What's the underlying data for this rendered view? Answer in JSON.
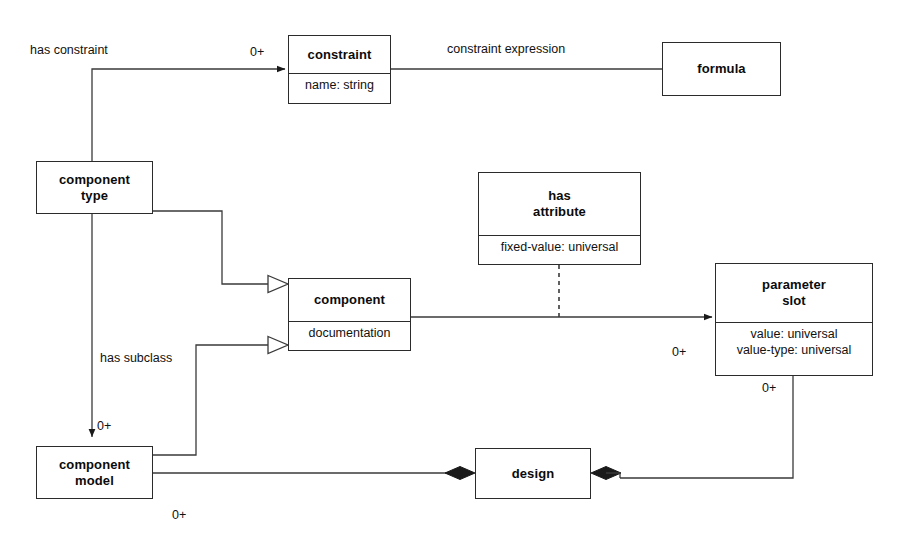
{
  "diagram": {
    "stroke_color": "#2b2b2b",
    "text_color": "#111111",
    "background": "#ffffff",
    "nodes": [
      {
        "id": "constraint",
        "title": "constraint",
        "attributes": [
          "name: string"
        ],
        "x": 288,
        "y": 35,
        "width": 103,
        "height": 69,
        "title_height": 33
      },
      {
        "id": "formula",
        "title": "formula",
        "attributes": [],
        "x": 662,
        "y": 42,
        "width": 119,
        "height": 54,
        "title_height": 54
      },
      {
        "id": "component-type",
        "title": "component\ntype",
        "attributes": [],
        "x": 36,
        "y": 161,
        "width": 117,
        "height": 53,
        "title_height": 53
      },
      {
        "id": "has-attribute",
        "title": "has\nattribute",
        "attributes": [
          "fixed-value: universal"
        ],
        "x": 478,
        "y": 172,
        "width": 163,
        "height": 93,
        "title_height": 58
      },
      {
        "id": "component",
        "title": "component",
        "attributes": [
          "documentation"
        ],
        "x": 288,
        "y": 278,
        "width": 123,
        "height": 73,
        "title_height": 38
      },
      {
        "id": "parameter-slot",
        "title": "parameter\nslot",
        "attributes": [
          "value: universal",
          "value-type: universal"
        ],
        "x": 715,
        "y": 263,
        "width": 158,
        "height": 113,
        "title_height": 54
      },
      {
        "id": "component-model",
        "title": "component\nmodel",
        "attributes": [],
        "x": 36,
        "y": 446,
        "width": 117,
        "height": 53,
        "title_height": 53
      },
      {
        "id": "design",
        "title": "design",
        "attributes": [],
        "x": 475,
        "y": 448,
        "width": 116,
        "height": 51,
        "title_height": 51
      }
    ],
    "edge_labels": [
      {
        "id": "has-constraint",
        "text": "has constraint",
        "x": 30,
        "y": 43
      },
      {
        "id": "constraint-expression",
        "text": "constraint expression",
        "x": 447,
        "y": 42
      },
      {
        "id": "has-subclass",
        "text": "has subclass",
        "x": 100,
        "y": 351
      }
    ],
    "multiplicities": [
      {
        "id": "mult-constraint",
        "text": "0+",
        "x": 250,
        "y": 45
      },
      {
        "id": "mult-parameter-slot-in",
        "text": "0+",
        "x": 672,
        "y": 345
      },
      {
        "id": "mult-parameter-slot-out",
        "text": "0+",
        "x": 762,
        "y": 381
      },
      {
        "id": "mult-component-model-in",
        "text": "0+",
        "x": 97,
        "y": 419
      },
      {
        "id": "mult-component-model-out",
        "text": "0+",
        "x": 172,
        "y": 508
      }
    ],
    "connectors": [
      {
        "id": "component-type-to-constraint",
        "kind": "arrow-filled"
      },
      {
        "id": "constraint-to-formula",
        "kind": "plain"
      },
      {
        "id": "component-type-to-component",
        "kind": "generalization-triangle"
      },
      {
        "id": "component-model-to-component",
        "kind": "generalization-triangle"
      },
      {
        "id": "component-type-to-component-model",
        "kind": "arrow-filled"
      },
      {
        "id": "component-to-parameter-slot",
        "kind": "arrow-filled"
      },
      {
        "id": "has-attribute-to-association",
        "kind": "dashed"
      },
      {
        "id": "component-model-to-design",
        "kind": "aggregation-diamond"
      },
      {
        "id": "parameter-slot-to-design",
        "kind": "aggregation-diamond"
      }
    ]
  }
}
